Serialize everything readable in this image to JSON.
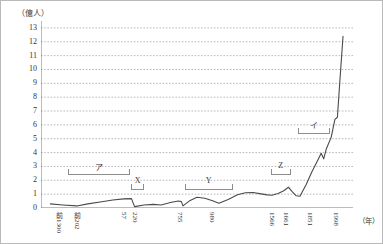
{
  "chart_data": {
    "type": "line",
    "title": "",
    "subtitle": "",
    "ylabel": "（億人）",
    "xlabel": "（年）",
    "ylim": [
      0,
      13.5
    ],
    "yticks": [
      0,
      1,
      2,
      3,
      4,
      5,
      6,
      7,
      8,
      9,
      10,
      11,
      12,
      13
    ],
    "ytick_labels": [
      "0",
      "1",
      "2",
      "3",
      "4",
      "5",
      "6",
      "7",
      "8",
      "9",
      "10",
      "11",
      "12",
      "13"
    ],
    "grid": "horizontal-dotted",
    "legend": "none",
    "xtick_labels": [
      "前1300",
      "前202",
      "57",
      "220",
      "755",
      "980",
      "1566",
      "1661",
      "1851",
      "1998"
    ],
    "xtick_positions_frac": [
      0.055,
      0.115,
      0.265,
      0.3,
      0.445,
      0.545,
      0.74,
      0.785,
      0.86,
      0.945
    ],
    "x": [
      "前1300",
      "前202",
      "57",
      "220",
      "755",
      "980",
      "1566",
      "1661",
      "1851",
      "1998"
    ],
    "series": [
      {
        "name": "中国の人口",
        "unit": "億人",
        "points": [
          {
            "xf": 0.03,
            "y": 0.3
          },
          {
            "xf": 0.07,
            "y": 0.22
          },
          {
            "xf": 0.115,
            "y": 0.15
          },
          {
            "xf": 0.15,
            "y": 0.3
          },
          {
            "xf": 0.195,
            "y": 0.45
          },
          {
            "xf": 0.23,
            "y": 0.58
          },
          {
            "xf": 0.265,
            "y": 0.66
          },
          {
            "xf": 0.29,
            "y": 0.68
          },
          {
            "xf": 0.3,
            "y": 0.1
          },
          {
            "xf": 0.33,
            "y": 0.22
          },
          {
            "xf": 0.36,
            "y": 0.26
          },
          {
            "xf": 0.385,
            "y": 0.22
          },
          {
            "xf": 0.415,
            "y": 0.4
          },
          {
            "xf": 0.44,
            "y": 0.5
          },
          {
            "xf": 0.45,
            "y": 0.46
          },
          {
            "xf": 0.455,
            "y": 0.15
          },
          {
            "xf": 0.478,
            "y": 0.55
          },
          {
            "xf": 0.5,
            "y": 0.78
          },
          {
            "xf": 0.525,
            "y": 0.7
          },
          {
            "xf": 0.55,
            "y": 0.52
          },
          {
            "xf": 0.57,
            "y": 0.34
          },
          {
            "xf": 0.6,
            "y": 0.62
          },
          {
            "xf": 0.63,
            "y": 0.95
          },
          {
            "xf": 0.655,
            "y": 1.1
          },
          {
            "xf": 0.68,
            "y": 1.12
          },
          {
            "xf": 0.705,
            "y": 1.02
          },
          {
            "xf": 0.725,
            "y": 0.95
          },
          {
            "xf": 0.74,
            "y": 0.92
          },
          {
            "xf": 0.76,
            "y": 1.05
          },
          {
            "xf": 0.778,
            "y": 1.25
          },
          {
            "xf": 0.793,
            "y": 1.5
          },
          {
            "xf": 0.805,
            "y": 1.18
          },
          {
            "xf": 0.818,
            "y": 0.88
          },
          {
            "xf": 0.83,
            "y": 0.85
          },
          {
            "xf": 0.85,
            "y": 1.7
          },
          {
            "xf": 0.868,
            "y": 2.6
          },
          {
            "xf": 0.885,
            "y": 3.35
          },
          {
            "xf": 0.898,
            "y": 3.95
          },
          {
            "xf": 0.906,
            "y": 3.55
          },
          {
            "xf": 0.915,
            "y": 4.3
          },
          {
            "xf": 0.93,
            "y": 5.1
          },
          {
            "xf": 0.942,
            "y": 6.4
          },
          {
            "xf": 0.95,
            "y": 6.55
          },
          {
            "xf": 0.958,
            "y": 9.2
          },
          {
            "xf": 0.968,
            "y": 12.4
          }
        ]
      }
    ],
    "annotations": [
      {
        "label": "ア",
        "x_start_frac": 0.085,
        "x_end_frac": 0.285,
        "y_value": 2.35,
        "label_y_value": 3.05
      },
      {
        "label": "X",
        "x_start_frac": 0.29,
        "x_end_frac": 0.33,
        "y_value": 1.3,
        "label_y_value": 1.95
      },
      {
        "label": "Y",
        "x_start_frac": 0.46,
        "x_end_frac": 0.615,
        "y_value": 1.3,
        "label_y_value": 1.95
      },
      {
        "label": "Z",
        "x_start_frac": 0.737,
        "x_end_frac": 0.8,
        "y_value": 2.35,
        "label_y_value": 3.0
      },
      {
        "label": "イ",
        "x_start_frac": 0.825,
        "x_end_frac": 0.925,
        "y_value": 5.35,
        "label_y_value": 6.05
      }
    ]
  }
}
